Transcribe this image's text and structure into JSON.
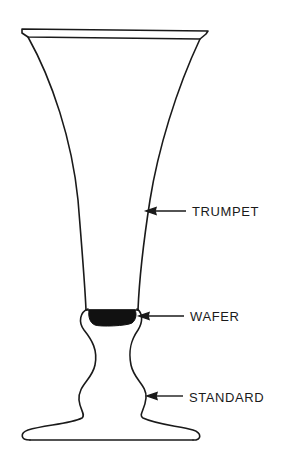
{
  "diagram": {
    "parts": [
      {
        "id": "trumpet",
        "label": "TRUMPET"
      },
      {
        "id": "wafer",
        "label": "WAFER"
      },
      {
        "id": "standard",
        "label": "STANDARD"
      }
    ],
    "colors": {
      "line": "#1a1a1a",
      "wafer_fill": "#111111",
      "background": "#ffffff"
    }
  }
}
